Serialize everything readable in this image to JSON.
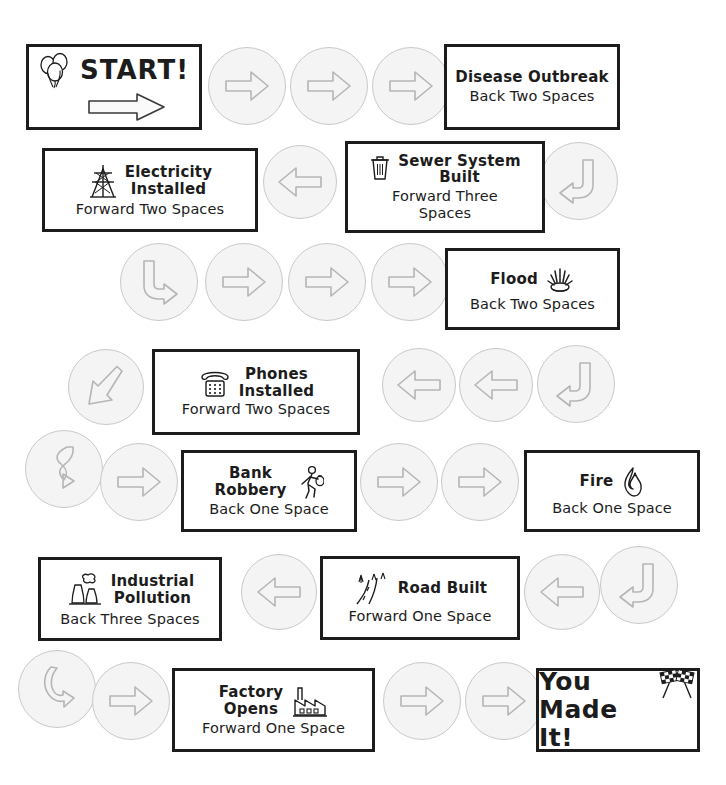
{
  "board": {
    "title": "Community Development Board Game Path",
    "width": 726,
    "height": 785,
    "colors": {
      "ink": "#1c1c1c",
      "circle_fill": "#f4f4f4",
      "circle_stroke": "#c9c9c9",
      "paper": "#ffffff"
    }
  },
  "spaces": [
    {
      "id": "start",
      "title": "START!",
      "sub": "",
      "icon": "balloons-icon",
      "arrow": "right-arrow-icon",
      "row": 1
    },
    {
      "id": "disease-outbreak",
      "title": "Disease Outbreak",
      "sub": "Back Two Spaces",
      "icon": "none",
      "row": 1
    },
    {
      "id": "electricity-installed",
      "title": "Electricity\nInstalled",
      "sub": "Forward Two Spaces",
      "icon": "power-tower-icon",
      "row": 2
    },
    {
      "id": "sewer-system-built",
      "title": "Sewer System\nBuilt",
      "sub": "Forward Three\nSpaces",
      "icon": "trash-can-icon",
      "row": 2
    },
    {
      "id": "flood",
      "title": "Flood",
      "sub": "Back Two Spaces",
      "icon": "water-splash-icon",
      "row": 3
    },
    {
      "id": "phones-installed",
      "title": "Phones\nInstalled",
      "sub": "Forward Two Spaces",
      "icon": "telephone-icon",
      "row": 4
    },
    {
      "id": "bank-robbery",
      "title": "Bank\nRobbery",
      "sub": "Back One Space",
      "icon": "running-thief-icon",
      "row": 5
    },
    {
      "id": "fire",
      "title": "Fire",
      "sub": "Back One Space",
      "icon": "flame-icon",
      "row": 5
    },
    {
      "id": "industrial-pollution",
      "title": "Industrial\nPollution",
      "sub": "Back Three Spaces",
      "icon": "smokestack-icon",
      "row": 6
    },
    {
      "id": "road-built",
      "title": "Road Built",
      "sub": "Forward One Space",
      "icon": "road-icon",
      "row": 6
    },
    {
      "id": "factory-opens",
      "title": "Factory\nOpens",
      "sub": "Forward One Space",
      "icon": "factory-icon",
      "row": 7
    },
    {
      "id": "you-made-it",
      "title": "You\nMade It!",
      "sub": "",
      "icon": "checkered-flags-icon",
      "row": 7
    }
  ],
  "steps": [
    {
      "id": "step-1",
      "direction": "right",
      "row": 1
    },
    {
      "id": "step-2",
      "direction": "right",
      "row": 1
    },
    {
      "id": "step-3",
      "direction": "right",
      "row": 1
    },
    {
      "id": "step-4",
      "direction": "turn-down-left",
      "row": 2
    },
    {
      "id": "step-5",
      "direction": "left",
      "row": 2
    },
    {
      "id": "step-6",
      "direction": "turn-down-right",
      "row": 3
    },
    {
      "id": "step-7",
      "direction": "right",
      "row": 3
    },
    {
      "id": "step-8",
      "direction": "right",
      "row": 3
    },
    {
      "id": "step-9",
      "direction": "right",
      "row": 3
    },
    {
      "id": "step-10",
      "direction": "turn-down-left",
      "row": 4
    },
    {
      "id": "step-11",
      "direction": "left",
      "row": 4
    },
    {
      "id": "step-12",
      "direction": "left",
      "row": 4
    },
    {
      "id": "step-13",
      "direction": "diagonal-down-left",
      "row": 4
    },
    {
      "id": "step-14",
      "direction": "curve-down",
      "row": 5
    },
    {
      "id": "step-15",
      "direction": "right",
      "row": 5
    },
    {
      "id": "step-16",
      "direction": "right",
      "row": 5
    },
    {
      "id": "step-17",
      "direction": "right",
      "row": 5
    },
    {
      "id": "step-18",
      "direction": "turn-down-left",
      "row": 6
    },
    {
      "id": "step-19",
      "direction": "left",
      "row": 6
    },
    {
      "id": "step-20",
      "direction": "left",
      "row": 6
    },
    {
      "id": "step-21",
      "direction": "curve-down-right",
      "row": 7
    },
    {
      "id": "step-22",
      "direction": "right",
      "row": 7
    },
    {
      "id": "step-23",
      "direction": "right",
      "row": 7
    },
    {
      "id": "step-24",
      "direction": "right",
      "row": 7
    }
  ]
}
